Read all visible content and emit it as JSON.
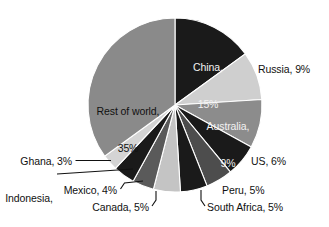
{
  "chart_data": {
    "type": "pie",
    "title": "",
    "subtitle": "",
    "xlabel": "",
    "ylabel": "",
    "legend_position": "none",
    "grid": false,
    "units": "percent",
    "start_angle_deg": 0,
    "direction": "clockwise",
    "categories": [
      "China",
      "Russia",
      "Australia",
      "US",
      "Peru",
      "South Africa",
      "Canada",
      "Mexico",
      "Indonesia",
      "Ghana",
      "Rest of world"
    ],
    "values": [
      15,
      9,
      9,
      6,
      5,
      5,
      5,
      4,
      4,
      3,
      35
    ],
    "slices": [
      {
        "name": "China",
        "label": "China,\n15%",
        "label_line1": "China,",
        "label_line2": "15%",
        "value": 15,
        "value_text": "15%",
        "color": "#1a1a1a",
        "label_placement": "inside",
        "label_color": "#f2f2f2",
        "leader": false
      },
      {
        "name": "Russia",
        "label": "Russia, 9%",
        "value": 9,
        "value_text": "9%",
        "color": "#cfcfcf",
        "label_placement": "outside",
        "label_color": "#111111",
        "leader": false
      },
      {
        "name": "Australia",
        "label": "Australia,\n9%",
        "label_line1": "Australia,",
        "label_line2": "9%",
        "value": 9,
        "value_text": "9%",
        "color": "#8c8c8c",
        "label_placement": "inside",
        "label_color": "#f2f2f2",
        "leader": false
      },
      {
        "name": "US",
        "label": "US, 6%",
        "value": 6,
        "value_text": "6%",
        "color": "#1a1a1a",
        "label_placement": "outside",
        "label_color": "#111111",
        "leader": false
      },
      {
        "name": "Peru",
        "label": "Peru, 5%",
        "value": 5,
        "value_text": "5%",
        "color": "#4d4d4d",
        "label_placement": "outside",
        "label_color": "#111111",
        "leader": false
      },
      {
        "name": "South Africa",
        "label": "South Africa, 5%",
        "value": 5,
        "value_text": "5%",
        "color": "#1a1a1a",
        "label_placement": "outside",
        "label_color": "#111111",
        "leader": true
      },
      {
        "name": "Canada",
        "label": "Canada, 5%",
        "value": 5,
        "value_text": "5%",
        "color": "#c4c4c4",
        "label_placement": "outside",
        "label_color": "#111111",
        "leader": true
      },
      {
        "name": "Mexico",
        "label": "Mexico, 4%",
        "value": 4,
        "value_text": "4%",
        "color": "#5a5a5a",
        "label_placement": "outside",
        "label_color": "#111111",
        "leader": true
      },
      {
        "name": "Indonesia",
        "label": "Indonesia,\n4%",
        "label_line1": "Indonesia,",
        "label_line2": "4%",
        "value": 4,
        "value_text": "4%",
        "color": "#1a1a1a",
        "label_placement": "outside",
        "label_color": "#111111",
        "leader": true
      },
      {
        "name": "Ghana",
        "label": "Ghana, 3%",
        "value": 3,
        "value_text": "3%",
        "color": "#d4d4d4",
        "label_placement": "outside",
        "label_color": "#111111",
        "leader": true
      },
      {
        "name": "Rest of world",
        "label": "Rest of world,\n35%",
        "label_line1": "Rest of world,",
        "label_line2": "35%",
        "value": 35,
        "value_text": "35%",
        "color": "#8a8a8a",
        "label_placement": "inside",
        "label_color": "#111111",
        "leader": false
      }
    ],
    "background_color": "#ffffff",
    "slice_border_color": "#ffffff"
  }
}
